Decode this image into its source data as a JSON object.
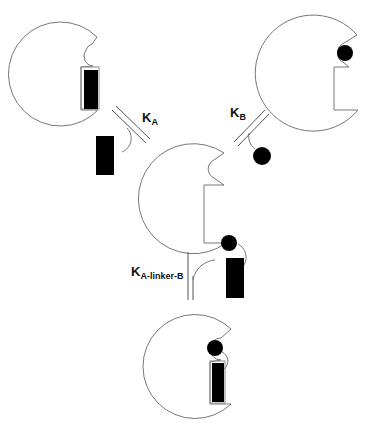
{
  "diagram": {
    "type": "binding-equilibrium-scheme",
    "shapes": [
      {
        "id": "receptor-top-left",
        "ligand": "rectangle-bound"
      },
      {
        "id": "receptor-top-right",
        "ligand": "circle-bound"
      },
      {
        "id": "receptor-center",
        "ligand": "none"
      },
      {
        "id": "receptor-bottom",
        "ligand": "rectangle-circle-linked-bound"
      }
    ],
    "equilibria": {
      "ka": {
        "main": "K",
        "sub": "A"
      },
      "kb": {
        "main": "K",
        "sub": "B"
      },
      "klinker": {
        "main": "K",
        "sub": "A-linker-B"
      }
    },
    "colors": {
      "outline": "#777777",
      "ligand": "#000000",
      "background": "#ffffff"
    }
  }
}
